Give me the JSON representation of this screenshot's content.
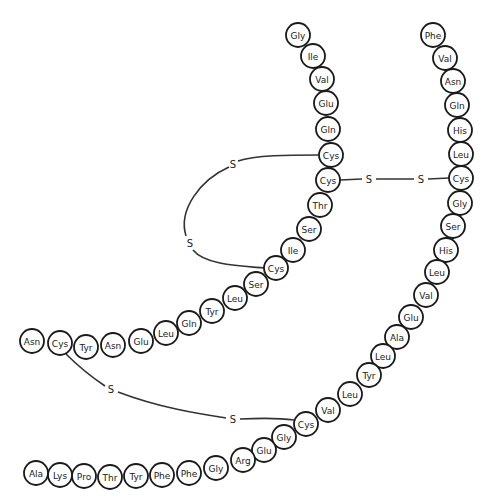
{
  "colors": {
    "stroke": "#1a1a1a",
    "bond": "#333333",
    "background": "#ffffff"
  },
  "residue_radius": 12,
  "chains": [
    {
      "name": "A-chain",
      "residues": [
        {
          "label": "Gly",
          "x": 298,
          "y": 35
        },
        {
          "label": "Ile",
          "x": 313,
          "y": 56
        },
        {
          "label": "Val",
          "x": 322,
          "y": 79
        },
        {
          "label": "Glu",
          "x": 326,
          "y": 103
        },
        {
          "label": "Gln",
          "x": 328,
          "y": 129
        },
        {
          "label": "Cys",
          "x": 331,
          "y": 155
        },
        {
          "label": "Cys",
          "x": 328,
          "y": 180
        },
        {
          "label": "Thr",
          "x": 320,
          "y": 205
        },
        {
          "label": "Ser",
          "x": 309,
          "y": 229
        },
        {
          "label": "Ile",
          "x": 293,
          "y": 250
        },
        {
          "label": "Cys",
          "x": 276,
          "y": 268
        },
        {
          "label": "Ser",
          "x": 256,
          "y": 284
        },
        {
          "label": "Leu",
          "x": 235,
          "y": 298
        },
        {
          "label": "Tyr",
          "x": 212,
          "y": 311
        },
        {
          "label": "Gln",
          "x": 189,
          "y": 323
        },
        {
          "label": "Leu",
          "x": 166,
          "y": 333
        },
        {
          "label": "Glu",
          "x": 141,
          "y": 341
        },
        {
          "label": "Asn",
          "x": 113,
          "y": 345
        },
        {
          "label": "Tyr",
          "x": 86,
          "y": 347
        },
        {
          "label": "Cys",
          "x": 60,
          "y": 343
        },
        {
          "label": "Asn",
          "x": 32,
          "y": 341
        }
      ]
    },
    {
      "name": "B-chain",
      "residues": [
        {
          "label": "Phe",
          "x": 433,
          "y": 35
        },
        {
          "label": "Val",
          "x": 445,
          "y": 58
        },
        {
          "label": "Asn",
          "x": 453,
          "y": 81
        },
        {
          "label": "Gln",
          "x": 457,
          "y": 105
        },
        {
          "label": "His",
          "x": 460,
          "y": 130
        },
        {
          "label": "Leu",
          "x": 461,
          "y": 154
        },
        {
          "label": "Cys",
          "x": 461,
          "y": 178
        },
        {
          "label": "Gly",
          "x": 460,
          "y": 203
        },
        {
          "label": "Ser",
          "x": 453,
          "y": 226
        },
        {
          "label": "His",
          "x": 446,
          "y": 250
        },
        {
          "label": "Leu",
          "x": 437,
          "y": 272
        },
        {
          "label": "Val",
          "x": 426,
          "y": 295
        },
        {
          "label": "Glu",
          "x": 411,
          "y": 317
        },
        {
          "label": "Ala",
          "x": 397,
          "y": 337
        },
        {
          "label": "Leu",
          "x": 383,
          "y": 356
        },
        {
          "label": "Tyr",
          "x": 369,
          "y": 375
        },
        {
          "label": "Leu",
          "x": 350,
          "y": 394
        },
        {
          "label": "Val",
          "x": 328,
          "y": 410
        },
        {
          "label": "Cys",
          "x": 306,
          "y": 424
        },
        {
          "label": "Gly",
          "x": 284,
          "y": 437
        },
        {
          "label": "Glu",
          "x": 264,
          "y": 450
        },
        {
          "label": "Arg",
          "x": 243,
          "y": 460
        },
        {
          "label": "Gly",
          "x": 216,
          "y": 468
        },
        {
          "label": "Phe",
          "x": 189,
          "y": 473
        },
        {
          "label": "Phe",
          "x": 162,
          "y": 475
        },
        {
          "label": "Tyr",
          "x": 136,
          "y": 476
        },
        {
          "label": "Thr",
          "x": 110,
          "y": 477
        },
        {
          "label": "Pro",
          "x": 84,
          "y": 476
        },
        {
          "label": "Lys",
          "x": 60,
          "y": 475
        },
        {
          "label": "Ala",
          "x": 36,
          "y": 473
        }
      ]
    }
  ],
  "disulfide_bonds": [
    {
      "name": "intrachain-A6-A11",
      "path": "M 319 155 C 290 155, 255 155, 238 161 M 229 167 C 200 180, 178 210, 186 236 M 193 250 C 205 265, 240 266, 264 268",
      "labels": [
        {
          "text": "S",
          "x": 233,
          "y": 164
        },
        {
          "text": "S",
          "x": 190,
          "y": 243
        }
      ]
    },
    {
      "name": "interchain-A7-B7",
      "path": "M 340 180 L 362 179 M 376 179 L 414 179 M 428 179 L 449 178",
      "labels": [
        {
          "text": "S",
          "x": 369,
          "y": 179
        },
        {
          "text": "S",
          "x": 421,
          "y": 179
        }
      ]
    },
    {
      "name": "interchain-A20-B19",
      "path": "M 66 354 C 80 368, 90 376, 105 386 M 118 392 C 160 408, 200 414, 226 418 M 240 419 C 262 418, 280 418, 294 420",
      "labels": [
        {
          "text": "S",
          "x": 111,
          "y": 389
        },
        {
          "text": "S",
          "x": 233,
          "y": 419
        }
      ]
    }
  ]
}
